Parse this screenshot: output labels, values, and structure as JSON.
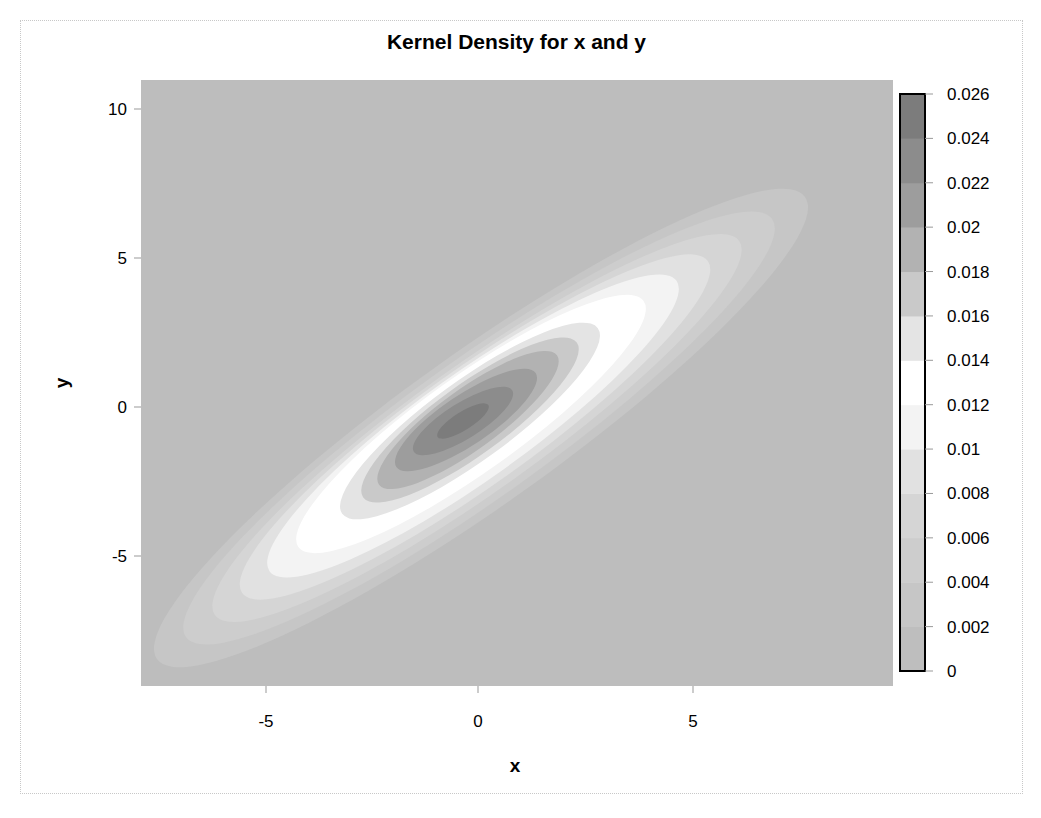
{
  "chart_data": {
    "type": "heatmap",
    "subtype": "filled-contour (kernel density estimate)",
    "title": "Kernel Density for x and y",
    "xlabel": "x",
    "ylabel": "y",
    "xlim": [
      -7.9,
      9.8
    ],
    "ylim": [
      -9.4,
      11.0
    ],
    "x_ticks": [
      -5,
      0,
      5
    ],
    "y_ticks": [
      -5,
      0,
      5,
      10
    ],
    "x_tick_labels": [
      "-5",
      "0",
      "5"
    ],
    "y_tick_labels": [
      "-5",
      "0",
      "5",
      "10"
    ],
    "grid": false,
    "colorbar": {
      "position": "right",
      "min": 0,
      "max": 0.026,
      "tick_labels": [
        "0.026",
        "0.024",
        "0.022",
        "0.02",
        "0.018",
        "0.016",
        "0.014",
        "0.012",
        "0.01",
        "0.008",
        "0.006",
        "0.004",
        "0.002",
        "0"
      ],
      "levels": [
        {
          "from": 0.0,
          "to": 0.002,
          "color": "#bebebe"
        },
        {
          "from": 0.002,
          "to": 0.004,
          "color": "#c6c6c6"
        },
        {
          "from": 0.004,
          "to": 0.006,
          "color": "#cdcdcd"
        },
        {
          "from": 0.006,
          "to": 0.008,
          "color": "#d5d5d5"
        },
        {
          "from": 0.008,
          "to": 0.01,
          "color": "#e1e1e1"
        },
        {
          "from": 0.01,
          "to": 0.012,
          "color": "#f3f3f3"
        },
        {
          "from": 0.012,
          "to": 0.014,
          "color": "#ffffff"
        },
        {
          "from": 0.014,
          "to": 0.016,
          "color": "#e4e4e4"
        },
        {
          "from": 0.016,
          "to": 0.018,
          "color": "#c9c9c9"
        },
        {
          "from": 0.018,
          "to": 0.02,
          "color": "#b2b2b2"
        },
        {
          "from": 0.02,
          "to": 0.022,
          "color": "#9d9d9d"
        },
        {
          "from": 0.022,
          "to": 0.024,
          "color": "#8c8c8c"
        },
        {
          "from": 0.024,
          "to": 0.026,
          "color": "#7c7c7c"
        }
      ]
    },
    "density_summary": {
      "peak_location": {
        "x": -0.3,
        "y": -0.4
      },
      "peak_density_approx": 0.025,
      "orientation": "positively correlated, elongated along diagonal (slope ~0.8)",
      "support_extent": {
        "x": [
          -7.3,
          7.8
        ],
        "y": [
          -7.5,
          7.3
        ]
      }
    },
    "contours_px": [
      {
        "level": 0.002,
        "cx": 481,
        "cy": 428,
        "rx": 398,
        "ry": 76,
        "angle": -35.5,
        "color": "#c6c6c6"
      },
      {
        "level": 0.004,
        "cx": 479,
        "cy": 428,
        "rx": 360,
        "ry": 69,
        "angle": -35.5,
        "color": "#cdcdcd"
      },
      {
        "level": 0.006,
        "cx": 477,
        "cy": 428,
        "rx": 322,
        "ry": 63,
        "angle": -35.5,
        "color": "#d5d5d5"
      },
      {
        "level": 0.008,
        "cx": 475,
        "cy": 427,
        "rx": 286,
        "ry": 58,
        "angle": -35.5,
        "color": "#e1e1e1"
      },
      {
        "level": 0.01,
        "cx": 473,
        "cy": 426,
        "rx": 250,
        "ry": 53,
        "angle": -35.5,
        "color": "#f3f3f3"
      },
      {
        "level": 0.012,
        "cx": 471,
        "cy": 424,
        "rx": 212,
        "ry": 48,
        "angle": -35.5,
        "color": "#ffffff"
      },
      {
        "level": 0.014,
        "cx": 470,
        "cy": 421,
        "rx": 158,
        "ry": 40,
        "angle": -36,
        "color": "#e4e4e4"
      },
      {
        "level": 0.016,
        "cx": 470,
        "cy": 420,
        "rx": 132,
        "ry": 35,
        "angle": -36,
        "color": "#c9c9c9"
      },
      {
        "level": 0.018,
        "cx": 468,
        "cy": 420,
        "rx": 110,
        "ry": 30,
        "angle": -36,
        "color": "#b2b2b2"
      },
      {
        "level": 0.02,
        "cx": 466,
        "cy": 420,
        "rx": 84,
        "ry": 25,
        "angle": -34,
        "color": "#9d9d9d"
      },
      {
        "level": 0.022,
        "cx": 463,
        "cy": 421,
        "rx": 58,
        "ry": 18,
        "angle": -32,
        "color": "#8c8c8c"
      },
      {
        "level": 0.024,
        "cx": 463,
        "cy": 421,
        "rx": 30,
        "ry": 9,
        "angle": -32,
        "color": "#7c7c7c"
      }
    ]
  },
  "colors": {
    "background": "#bdbdbd",
    "frame_border": "#c8c8c8",
    "colorbar_border": "#000000"
  }
}
